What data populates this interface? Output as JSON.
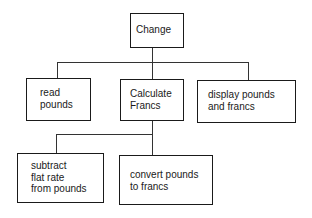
{
  "diagram": {
    "type": "structure-chart",
    "root": {
      "label": "Change",
      "children": [
        {
          "label": "read\npounds"
        },
        {
          "label": "Calculate\nFrancs",
          "children": [
            {
              "label": "subtract\nflat rate\nfrom pounds"
            },
            {
              "label": "convert pounds\nto francs"
            }
          ]
        },
        {
          "label": "display pounds\nand francs"
        }
      ]
    }
  },
  "nodes": {
    "change": "Change",
    "read_pounds": "read\npounds",
    "calculate_francs": "Calculate\nFrancs",
    "display": "display pounds\nand francs",
    "subtract": "subtract\nflat rate\nfrom pounds",
    "convert": "convert pounds\nto francs"
  }
}
